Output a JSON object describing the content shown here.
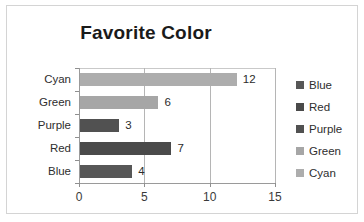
{
  "chart_data": {
    "type": "bar",
    "orientation": "horizontal",
    "title": "Favorite Color",
    "xlabel": "",
    "ylabel": "",
    "categories": [
      "Blue",
      "Red",
      "Purple",
      "Green",
      "Cyan"
    ],
    "values": [
      4,
      7,
      3,
      6,
      12
    ],
    "data_labels": [
      "4",
      "7",
      "3",
      "6",
      "12"
    ],
    "display_order_top_to_bottom": [
      "Cyan",
      "Green",
      "Purple",
      "Red",
      "Blue"
    ],
    "xlim": [
      0,
      15
    ],
    "xticks": [
      0,
      5,
      10,
      15
    ],
    "xtick_labels": [
      "0",
      "5",
      "10",
      "15"
    ],
    "grid": "vertical",
    "legend_position": "right",
    "legend": [
      {
        "label": "Blue",
        "color": "#575757"
      },
      {
        "label": "Red",
        "color": "#4a4a4a"
      },
      {
        "label": "Purple",
        "color": "#515151"
      },
      {
        "label": "Green",
        "color": "#a6a6a6"
      },
      {
        "label": "Cyan",
        "color": "#adadad"
      }
    ],
    "bars": [
      {
        "category": "Cyan",
        "value": 12,
        "label": "12",
        "color": "#adadad"
      },
      {
        "category": "Green",
        "value": 6,
        "label": "6",
        "color": "#a6a6a6"
      },
      {
        "category": "Purple",
        "value": 3,
        "label": "3",
        "color": "#515151"
      },
      {
        "category": "Red",
        "value": 7,
        "label": "7",
        "color": "#4a4a4a"
      },
      {
        "category": "Blue",
        "value": 4,
        "label": "4",
        "color": "#575757"
      }
    ],
    "colors": {
      "border": "#d4d4d4",
      "axis": "#9a9a9a",
      "gridline": "#b5b5b5",
      "text": "#2e2e2e",
      "title": "#1a1a1a",
      "background": "#ffffff"
    }
  }
}
